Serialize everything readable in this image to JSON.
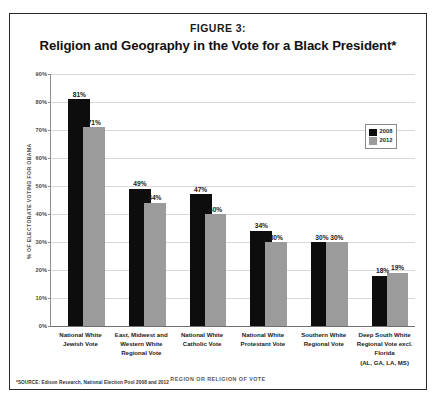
{
  "figure": {
    "label": "FIGURE 3:",
    "title": "Religion and Geography in the Vote for a Black President*",
    "source_note": "*SOURCE: Edison Research, National Election Pool 2008 and 2012"
  },
  "legend": {
    "position": "top-right-inside",
    "entries": [
      {
        "name": "2008",
        "color": "#0d0d0d"
      },
      {
        "name": "2012",
        "color": "#9b9b9b"
      }
    ]
  },
  "chart_data": {
    "type": "bar",
    "title": "Religion and Geography in the Vote for a Black President*",
    "subtitle": "FIGURE 3:",
    "xlabel": "REGION OR RELIGION OF VOTE",
    "ylabel": "% OF ELECTORATE VOTING FOR OBAMA",
    "ylim": [
      0,
      90
    ],
    "grid": true,
    "legend_position": "top-right",
    "ytick_labels": [
      "90%",
      "80%",
      "70%",
      "60%",
      "50%",
      "40%",
      "30%",
      "20%",
      "10%",
      "0%"
    ],
    "ytick_values": [
      90,
      80,
      70,
      60,
      50,
      40,
      30,
      20,
      10,
      0
    ],
    "categories": [
      "National White Jewish Vote",
      "East, Midwest and Western White Regional Vote",
      "National White Catholic Vote",
      "National White Protestant Vote",
      "Southern White Regional Vote",
      "Deep South White Regional Vote excl. Florida (AL, GA, LA, MS)"
    ],
    "category_lines": [
      [
        "National White",
        "Jewish Vote"
      ],
      [
        "East, Midwest and",
        "Western White",
        "Regional Vote"
      ],
      [
        "National White",
        "Catholic Vote"
      ],
      [
        "National White",
        "Protestant Vote"
      ],
      [
        "Southern White",
        "Regional Vote"
      ],
      [
        "Deep South White",
        "Regional Vote excl.",
        "Florida",
        "(AL, GA, LA, MS)"
      ]
    ],
    "series": [
      {
        "name": "2008",
        "color": "#0d0d0d",
        "values": [
          81,
          49,
          47,
          34,
          30,
          18
        ],
        "labels": [
          "81%",
          "49%",
          "47%",
          "34%",
          "30%",
          "18%"
        ]
      },
      {
        "name": "2012",
        "color": "#9b9b9b",
        "values": [
          71,
          44,
          40,
          30,
          30,
          19
        ],
        "labels": [
          "71%",
          "44%",
          "40%",
          "30%",
          "30%",
          "19%"
        ]
      }
    ]
  }
}
